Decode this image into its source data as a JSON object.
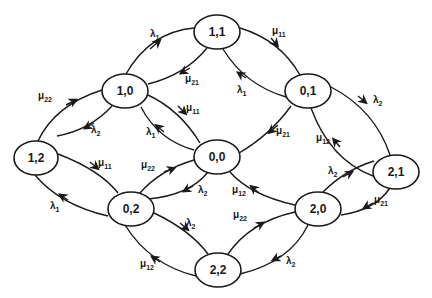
{
  "diagram": {
    "title": "",
    "nodes": [
      {
        "id": "n11",
        "label": "1,1",
        "x": 217,
        "y": 32
      },
      {
        "id": "n10",
        "label": "1,0",
        "x": 125,
        "y": 91
      },
      {
        "id": "n01",
        "label": "0,1",
        "x": 308,
        "y": 91
      },
      {
        "id": "n12",
        "label": "1,2",
        "x": 36,
        "y": 158
      },
      {
        "id": "n00",
        "label": "0,0",
        "x": 217,
        "y": 157
      },
      {
        "id": "n21",
        "label": "2,1",
        "x": 396,
        "y": 172
      },
      {
        "id": "n02",
        "label": "0,2",
        "x": 131,
        "y": 209
      },
      {
        "id": "n20",
        "label": "2,0",
        "x": 318,
        "y": 209
      },
      {
        "id": "n22",
        "label": "2,2",
        "x": 218,
        "y": 270
      }
    ],
    "edges": [
      {
        "from": "1,0",
        "to": "1,1",
        "sym": "λ",
        "sub": "1"
      },
      {
        "from": "1,1",
        "to": "1,0",
        "sym": "μ",
        "sub": "21"
      },
      {
        "from": "1,1",
        "to": "0,1",
        "sym": "μ",
        "sub": "11"
      },
      {
        "from": "0,1",
        "to": "1,1",
        "sym": "λ",
        "sub": "1"
      },
      {
        "from": "1,2",
        "to": "1,0",
        "sym": "μ",
        "sub": "22"
      },
      {
        "from": "1,0",
        "to": "1,2",
        "sym": "λ",
        "sub": "2"
      },
      {
        "from": "1,0",
        "to": "0,0",
        "sym": "μ",
        "sub": "11"
      },
      {
        "from": "0,0",
        "to": "1,0",
        "sym": "λ",
        "sub": "1"
      },
      {
        "from": "0,1",
        "to": "0,0",
        "sym": "μ",
        "sub": "21"
      },
      {
        "from": "0,1",
        "to": "2,1",
        "sym": "λ",
        "sub": "2"
      },
      {
        "from": "2,1",
        "to": "0,1",
        "sym": "μ",
        "sub": "12"
      },
      {
        "from": "1,2",
        "to": "0,2",
        "sym": "μ",
        "sub": "11"
      },
      {
        "from": "0,2",
        "to": "1,2",
        "sym": "λ",
        "sub": "1"
      },
      {
        "from": "0,2",
        "to": "0,0",
        "sym": "μ",
        "sub": "22"
      },
      {
        "from": "0,0",
        "to": "0,2",
        "sym": "λ",
        "sub": "2"
      },
      {
        "from": "2,0",
        "to": "0,0",
        "sym": "μ",
        "sub": "12"
      },
      {
        "from": "2,0",
        "to": "2,1",
        "sym": "λ",
        "sub": "2"
      },
      {
        "from": "2,1",
        "to": "2,0",
        "sym": "μ",
        "sub": "21"
      },
      {
        "from": "0,2",
        "to": "2,2",
        "sym": "λ",
        "sub": "2"
      },
      {
        "from": "2,2",
        "to": "0,2",
        "sym": "μ",
        "sub": "12"
      },
      {
        "from": "2,2",
        "to": "2,0",
        "sym": "μ",
        "sub": "22"
      },
      {
        "from": "2,0",
        "to": "2,2",
        "sym": "λ",
        "sub": "2"
      }
    ]
  },
  "labels": {
    "n11": "1,1",
    "n10": "1,0",
    "n01": "0,1",
    "n12": "1,2",
    "n00": "0,0",
    "n21": "2,1",
    "n02": "0,2",
    "n20": "2,0",
    "n22": "2,2",
    "lam": "λ",
    "mu": "μ",
    "s1": "1",
    "s2": "2",
    "s11": "11",
    "s12": "12",
    "s21": "21",
    "s22": "22"
  }
}
